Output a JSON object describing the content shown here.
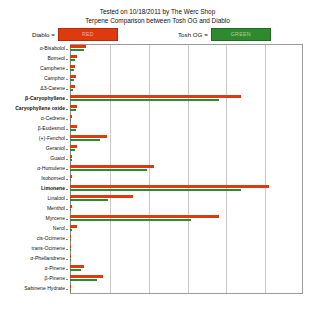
{
  "title": {
    "line1": "Tested on 10/18/2011 by The Werc Shop",
    "line2": "Terpene Comparison between Tosh OG and Diablo"
  },
  "legend": {
    "diablo_label": "Diablo =",
    "diablo_swatch_text": "RED",
    "diablo_color": "#dd3a10",
    "tosh_label": "Tosh OG =",
    "tosh_swatch_text": "GREEN",
    "tosh_color": "#2f8a2f"
  },
  "chart_data": {
    "type": "bar",
    "orientation": "horizontal",
    "title": "Terpene Comparison between Tosh OG and Diablo",
    "subtitle": "Tested on 10/18/2011 by The Werc Shop",
    "xlabel": "",
    "ylabel": "",
    "grid": true,
    "gridlines": 5,
    "xlim": [
      0,
      1.0
    ],
    "xticklabels": [],
    "legend_position": "top",
    "categories": [
      "α-Bisabolol",
      "Borneol",
      "Camphene",
      "Camphor",
      "Δ3-Carene",
      "β-Caryophyllene",
      "Caryophyllene oxide",
      "α-Cedrene",
      "β-Eudesmol",
      "(+)-Fenchol",
      "Geraniol",
      "Guaiol",
      "α-Humulene",
      "Isoborneol",
      "Limonene",
      "Linalool",
      "Menthol",
      "Myrcene",
      "Nerol",
      "cis-Ocimene",
      "trans-Ocimene",
      "α-Phellandrene",
      "α-Pinene",
      "β-Pinene",
      "Sabinene Hydrate"
    ],
    "series": [
      {
        "name": "Diablo",
        "color": "#dd3a10",
        "values": [
          0.07,
          0.03,
          0.022,
          0.024,
          0.02,
          0.735,
          0.03,
          0.008,
          0.032,
          0.16,
          0.028,
          0.01,
          0.36,
          0.008,
          0.855,
          0.27,
          0.01,
          0.64,
          0.03,
          0.006,
          0.005,
          0.005,
          0.06,
          0.14,
          0.004
        ]
      },
      {
        "name": "Tosh OG",
        "color": "#2f8a2f",
        "values": [
          0.06,
          0.022,
          0.016,
          0.018,
          0.014,
          0.64,
          0.024,
          0.005,
          0.026,
          0.13,
          0.02,
          0.007,
          0.33,
          0.005,
          0.735,
          0.165,
          0.006,
          0.52,
          0.01,
          0.004,
          0.003,
          0.003,
          0.046,
          0.115,
          0.003
        ]
      }
    ]
  }
}
